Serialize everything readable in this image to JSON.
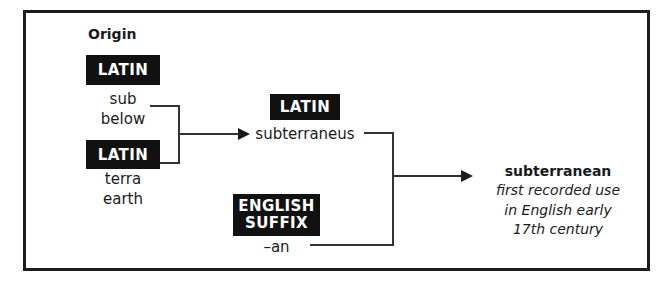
{
  "diagram": {
    "title_label": "Origin",
    "border_color": "#1d1d1d",
    "tag_bg": "#111111",
    "tag_fg": "#ffffff",
    "line_color": "#333333",
    "roots": [
      {
        "tag": "LATIN",
        "word": "sub",
        "gloss": "below"
      },
      {
        "tag": "LATIN",
        "word": "terra",
        "gloss": "earth"
      }
    ],
    "middle": {
      "tag": "LATIN",
      "word": "subterraneus"
    },
    "suffix": {
      "tag_line1": "ENGLISH",
      "tag_line2": "SUFFIX",
      "word": "–an"
    },
    "result": {
      "headword": "subterranean",
      "note_line1": "first recorded use",
      "note_line2": "in English early",
      "note_line3": "17th century"
    }
  }
}
